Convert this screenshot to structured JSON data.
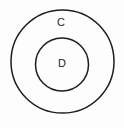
{
  "canvas": {
    "width": 124,
    "height": 128,
    "background_color": "#fdfdfd"
  },
  "diagram": {
    "type": "euler-diagram",
    "title": "",
    "stroke_color": "#1d1d1d",
    "label_color": "#1d1d1d",
    "sets": [
      {
        "id": "outer",
        "label": "C",
        "role": "containing-set",
        "shape": "circle",
        "center_x": 62.5,
        "center_y": 61.5,
        "radius": 51.5,
        "stroke_width": 1.5,
        "fill": "none",
        "label_x": 61,
        "label_y": 23
      },
      {
        "id": "inner",
        "label": "D",
        "role": "contained-subset",
        "shape": "circle",
        "center_x": 62,
        "center_y": 64.5,
        "radius": 26.5,
        "stroke_width": 1.5,
        "fill": "none",
        "label_x": 62,
        "label_y": 64
      }
    ]
  }
}
